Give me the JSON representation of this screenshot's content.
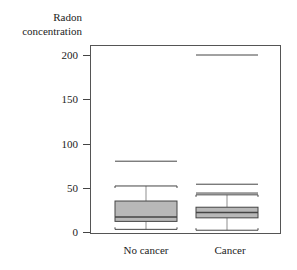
{
  "chart_data": {
    "type": "box",
    "title": "",
    "ylabel": "Radon concentration",
    "ylabel_lines": [
      "Radon",
      "concentration"
    ],
    "xlabel": "",
    "categories": [
      "No cancer",
      "Cancer"
    ],
    "ylim": [
      0,
      210
    ],
    "yticks": [
      0,
      50,
      100,
      150,
      200
    ],
    "grid": false,
    "series": [
      {
        "name": "No cancer",
        "whisker_low": 3,
        "q1": 12,
        "median": 17,
        "q3": 35,
        "whisker_high": 52,
        "outliers": [
          80
        ]
      },
      {
        "name": "Cancer",
        "whisker_low": 2,
        "q1": 16,
        "median": 22,
        "q3": 28,
        "whisker_high": 42,
        "outliers": [
          44,
          54,
          200
        ]
      }
    ],
    "colors": {
      "box_fill": "#b8b8b8",
      "line": "#444444",
      "frame": "#555555"
    }
  }
}
